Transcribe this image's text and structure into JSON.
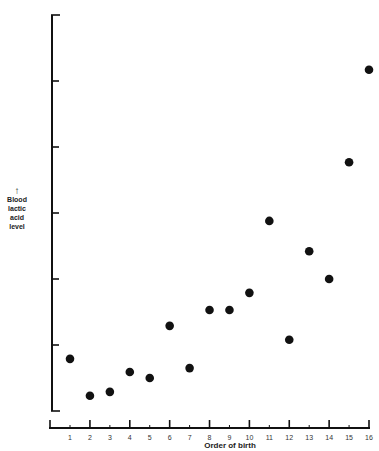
{
  "chart_data": {
    "type": "scatter",
    "title": "",
    "xlabel": "Order of birth",
    "ylabel": "Blood lactic acid level",
    "ylabel_lines": [
      "Blood",
      "lactic",
      "acid",
      "level"
    ],
    "ylabel_arrow": "↑",
    "x_ticks": [
      1,
      2,
      3,
      4,
      5,
      6,
      7,
      8,
      9,
      10,
      11,
      12,
      13,
      14,
      15,
      16
    ],
    "x_tick_labels": [
      "1",
      "2",
      "3",
      "4",
      "5",
      "6",
      "7",
      "8",
      "9",
      "10",
      "11",
      "12",
      "13",
      "14",
      "15",
      "16"
    ],
    "y_ticks_unlabeled": [
      0,
      1,
      2,
      3,
      4,
      5,
      6
    ],
    "xlim": [
      0,
      16
    ],
    "ylim": [
      0,
      6
    ],
    "grid": false,
    "legend": null,
    "marker_color": "#111111",
    "points": [
      {
        "x": 1,
        "y": 0.79
      },
      {
        "x": 2,
        "y": 0.23
      },
      {
        "x": 3,
        "y": 0.29
      },
      {
        "x": 4,
        "y": 0.59
      },
      {
        "x": 5,
        "y": 0.5
      },
      {
        "x": 6,
        "y": 1.29
      },
      {
        "x": 7,
        "y": 0.65
      },
      {
        "x": 8,
        "y": 1.53
      },
      {
        "x": 9,
        "y": 1.53
      },
      {
        "x": 10,
        "y": 1.79
      },
      {
        "x": 11,
        "y": 2.88
      },
      {
        "x": 12,
        "y": 1.08
      },
      {
        "x": 13,
        "y": 2.42
      },
      {
        "x": 14,
        "y": 2.0
      },
      {
        "x": 15,
        "y": 3.77
      },
      {
        "x": 16,
        "y": 5.17
      }
    ]
  }
}
